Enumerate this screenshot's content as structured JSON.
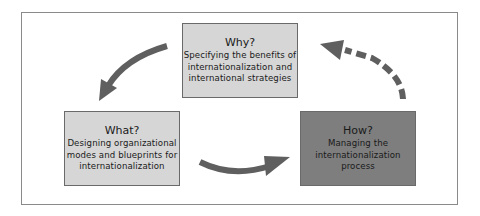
{
  "diagram": {
    "type": "cycle",
    "nodes": [
      {
        "id": "why",
        "title": "Why?",
        "description": "Specifying the benefits of\ninternationalization and\ninternational strategies",
        "fill": "#d6d6d6"
      },
      {
        "id": "what",
        "title": "What?",
        "description": "Designing organizational\nmodes and blueprints for\ninternationalization",
        "fill": "#d6d6d6"
      },
      {
        "id": "how",
        "title": "How?",
        "description": "Managing the\ninternationalization\nprocess",
        "fill": "#7e7e7e"
      }
    ],
    "edges": [
      {
        "from": "why",
        "to": "what",
        "style": "solid"
      },
      {
        "from": "what",
        "to": "how",
        "style": "solid"
      },
      {
        "from": "how",
        "to": "why",
        "style": "dashed"
      }
    ],
    "colors": {
      "arrow": "#5f5f5f",
      "border": "#6a6a6a",
      "frame": "#8a8a8a"
    }
  }
}
